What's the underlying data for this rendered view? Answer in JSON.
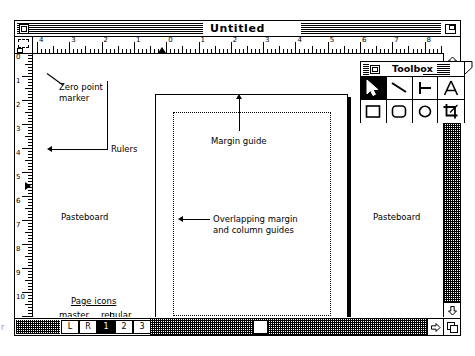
{
  "window": {
    "title": "Untitled",
    "close_box": "close-box",
    "zoom_box": "zoom-box"
  },
  "toolbox": {
    "title": "Toolbox",
    "tools": [
      {
        "name": "pointer-tool",
        "icon": "arrow-pointer-icon",
        "selected": true
      },
      {
        "name": "diagonal-line-tool",
        "icon": "diagonal-line-icon",
        "selected": false
      },
      {
        "name": "perpendicular-line-tool",
        "icon": "perpendicular-line-icon",
        "selected": false
      },
      {
        "name": "text-tool",
        "icon": "letter-a-icon",
        "selected": false
      },
      {
        "name": "rectangle-tool",
        "icon": "square-icon",
        "selected": false
      },
      {
        "name": "rounded-rectangle-tool",
        "icon": "rounded-square-icon",
        "selected": false
      },
      {
        "name": "ellipse-tool",
        "icon": "circle-icon",
        "selected": false
      },
      {
        "name": "crop-tool",
        "icon": "crop-icon",
        "selected": false
      }
    ]
  },
  "rulers": {
    "horizontal_ticks": [
      "4",
      "3",
      "2",
      "1",
      "0",
      "1",
      "2",
      "3",
      "4",
      "5",
      "6",
      "7",
      "8"
    ],
    "vertical_ticks": [
      "0",
      "1",
      "2",
      "3",
      "4",
      "5",
      "6",
      "7",
      "8",
      "9",
      "10",
      "11"
    ],
    "units": "inches"
  },
  "annotations": {
    "zero_point": "Zero point\nmarker",
    "rulers": "Rulers",
    "margin_guide": "Margin guide",
    "overlapping_guides": "Overlapping margin\nand column guides",
    "pasteboard_left": "Pasteboard",
    "pasteboard_right": "Pasteboard",
    "page_icons_heading": "Page icons",
    "page_icons_master": "master",
    "page_icons_regular": "regular",
    "edge_marker": "r"
  },
  "page_icons": [
    {
      "label": "L",
      "selected": false,
      "kind": "master"
    },
    {
      "label": "R",
      "selected": false,
      "kind": "master"
    },
    {
      "label": "1",
      "selected": true,
      "kind": "regular"
    },
    {
      "label": "2",
      "selected": false,
      "kind": "regular"
    },
    {
      "label": "3",
      "selected": false,
      "kind": "regular"
    },
    {
      "label": "4",
      "selected": false,
      "kind": "regular"
    }
  ],
  "scrollbars": {
    "vertical": "vertical-scrollbar",
    "horizontal": "horizontal-scrollbar",
    "grow_box": "grow-box"
  },
  "colors": {
    "ink": "#000000",
    "paper": "#ffffff"
  }
}
